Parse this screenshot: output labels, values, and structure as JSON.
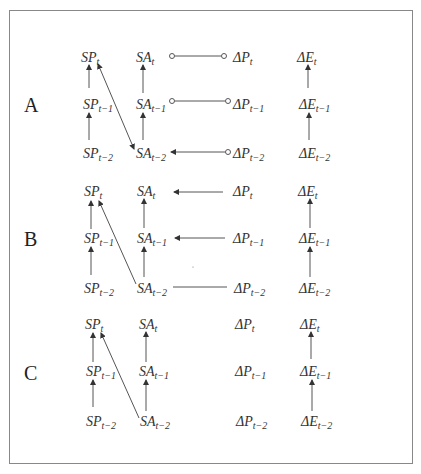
{
  "diagram": {
    "panels": [
      {
        "label": "A",
        "nodes": {
          "SP_t": {
            "base": "SP",
            "sub": "t"
          },
          "SP_t1": {
            "base": "SP",
            "sub": "t−1"
          },
          "SP_t2": {
            "base": "SP",
            "sub": "t−2"
          },
          "SA_t": {
            "base": "SA",
            "sub": "t"
          },
          "SA_t1": {
            "base": "SA",
            "sub": "t−1"
          },
          "SA_t2": {
            "base": "SA",
            "sub": "t−2"
          },
          "DP_t": {
            "base": "ΔP",
            "sub": "t"
          },
          "DP_t1": {
            "base": "ΔP",
            "sub": "t−1"
          },
          "DP_t2": {
            "base": "ΔP",
            "sub": "t−2"
          },
          "DE_t": {
            "base": "ΔE",
            "sub": "t"
          },
          "DE_t1": {
            "base": "ΔE",
            "sub": "t−1"
          },
          "DE_t2": {
            "base": "ΔE",
            "sub": "t−2"
          }
        },
        "edges": [
          {
            "from": "SP_t2",
            "to": "SP_t1",
            "type": "arrow"
          },
          {
            "from": "SP_t1",
            "to": "SP_t",
            "type": "arrow"
          },
          {
            "from": "SA_t2",
            "to": "SA_t1",
            "type": "arrow"
          },
          {
            "from": "SA_t1",
            "to": "SA_t",
            "type": "arrow"
          },
          {
            "from": "SA_t2",
            "to": "SP_t",
            "type": "bidirected"
          },
          {
            "from": "SA_t",
            "to": "DP_t",
            "type": "circle-circle"
          },
          {
            "from": "SA_t1",
            "to": "DP_t1",
            "type": "circle-circle"
          },
          {
            "from": "DP_t2",
            "to": "SA_t2",
            "type": "circle-arrow"
          },
          {
            "from": "DE_t2",
            "to": "DE_t1",
            "type": "arrow"
          },
          {
            "from": "DE_t1",
            "to": "DE_t",
            "type": "arrow"
          }
        ]
      },
      {
        "label": "B",
        "nodes": {
          "SP_t": {
            "base": "SP",
            "sub": "t"
          },
          "SP_t1": {
            "base": "SP",
            "sub": "t−1"
          },
          "SP_t2": {
            "base": "SP",
            "sub": "t−2"
          },
          "SA_t": {
            "base": "SA",
            "sub": "t"
          },
          "SA_t1": {
            "base": "SA",
            "sub": "t−1"
          },
          "SA_t2": {
            "base": "SA",
            "sub": "t−2"
          },
          "DP_t": {
            "base": "ΔP",
            "sub": "t"
          },
          "DP_t1": {
            "base": "ΔP",
            "sub": "t−1"
          },
          "DP_t2": {
            "base": "ΔP",
            "sub": "t−2"
          },
          "DE_t": {
            "base": "ΔE",
            "sub": "t"
          },
          "DE_t1": {
            "base": "ΔE",
            "sub": "t−1"
          },
          "DE_t2": {
            "base": "ΔE",
            "sub": "t−2"
          }
        },
        "edges": [
          {
            "from": "SP_t2",
            "to": "SP_t1",
            "type": "arrow"
          },
          {
            "from": "SP_t1",
            "to": "SP_t",
            "type": "arrow"
          },
          {
            "from": "SA_t2",
            "to": "SA_t1",
            "type": "arrow"
          },
          {
            "from": "SA_t1",
            "to": "SA_t",
            "type": "arrow"
          },
          {
            "from": "SA_t2",
            "to": "SP_t",
            "type": "arrow"
          },
          {
            "from": "DP_t",
            "to": "SA_t",
            "type": "arrow"
          },
          {
            "from": "DP_t1",
            "to": "SA_t1",
            "type": "arrow"
          },
          {
            "from": "DP_t2",
            "to": "SA_t2",
            "type": "line"
          },
          {
            "from": "DE_t2",
            "to": "DE_t1",
            "type": "arrow"
          },
          {
            "from": "DE_t1",
            "to": "DE_t",
            "type": "arrow"
          }
        ]
      },
      {
        "label": "C",
        "nodes": {
          "SP_t": {
            "base": "SP",
            "sub": "t"
          },
          "SP_t1": {
            "base": "SP",
            "sub": "t−1"
          },
          "SP_t2": {
            "base": "SP",
            "sub": "t−2"
          },
          "SA_t": {
            "base": "SA",
            "sub": "t"
          },
          "SA_t1": {
            "base": "SA",
            "sub": "t−1"
          },
          "SA_t2": {
            "base": "SA",
            "sub": "t−2"
          },
          "DP_t": {
            "base": "ΔP",
            "sub": "t"
          },
          "DP_t1": {
            "base": "ΔP",
            "sub": "t−1"
          },
          "DP_t2": {
            "base": "ΔP",
            "sub": "t−2"
          },
          "DE_t": {
            "base": "ΔE",
            "sub": "t"
          },
          "DE_t1": {
            "base": "ΔE",
            "sub": "t−1"
          },
          "DE_t2": {
            "base": "ΔE",
            "sub": "t−2"
          }
        },
        "edges": [
          {
            "from": "SP_t2",
            "to": "SP_t1",
            "type": "arrow"
          },
          {
            "from": "SP_t1",
            "to": "SP_t",
            "type": "arrow"
          },
          {
            "from": "SA_t2",
            "to": "SA_t1",
            "type": "arrow"
          },
          {
            "from": "SA_t1",
            "to": "SA_t",
            "type": "arrow"
          },
          {
            "from": "SA_t2",
            "to": "SP_t",
            "type": "arrow"
          },
          {
            "from": "DE_t2",
            "to": "DE_t1",
            "type": "arrow"
          },
          {
            "from": "DE_t1",
            "to": "DE_t",
            "type": "arrow"
          }
        ]
      }
    ]
  }
}
